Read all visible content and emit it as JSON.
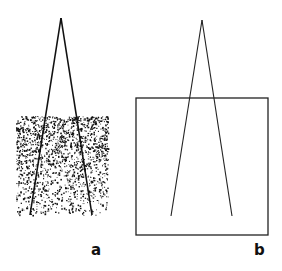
{
  "figure": {
    "panels": [
      {
        "id": "a",
        "label": "a",
        "style": "stippled-square",
        "description": "Two converging lines over a stippled square whose dot density decreases from top to bottom"
      },
      {
        "id": "b",
        "label": "b",
        "style": "outline-square",
        "description": "Two converging lines over an outlined square"
      }
    ],
    "colors": {
      "ink": "#111111",
      "background": "#ffffff"
    }
  }
}
